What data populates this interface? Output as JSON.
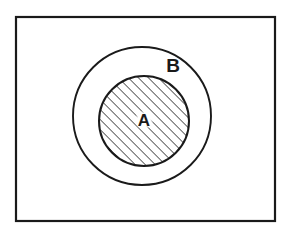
{
  "figure": {
    "type": "euler-diagram",
    "background_color": "#ffffff",
    "stroke_color": "#1a1a1a",
    "hatch_color": "#262626"
  },
  "universe_frame": {
    "name": "universal-set-rectangle",
    "x": 16,
    "y": 17,
    "width": 259,
    "height": 204,
    "stroke_width": 2.2,
    "fill": "#ffffff"
  },
  "sets": [
    {
      "id": "B",
      "label": "B",
      "role": "superset",
      "shape": "circle",
      "cx": 142,
      "cy": 116,
      "r": 69,
      "stroke_width": 1.9,
      "fill": "#ffffff",
      "filled": false,
      "label_x": 173,
      "label_y": 65,
      "label_font_size": 19
    },
    {
      "id": "A",
      "label": "A",
      "role": "subset",
      "shape": "circle",
      "cx": 144,
      "cy": 121,
      "r": 45,
      "stroke_width": 2.0,
      "fill": "hatched",
      "filled": true,
      "label_x": 144,
      "label_y": 120,
      "label_font_size": 17
    }
  ],
  "hatching": {
    "name": "diagonal-hatch",
    "angle_degrees": 45,
    "direction": "lower-left-to-upper-right",
    "spacing_px": 5,
    "line_width_px": 1.1,
    "color": "#262626"
  },
  "label_halo": {
    "color": "#ffffff",
    "radius_px": 8
  }
}
